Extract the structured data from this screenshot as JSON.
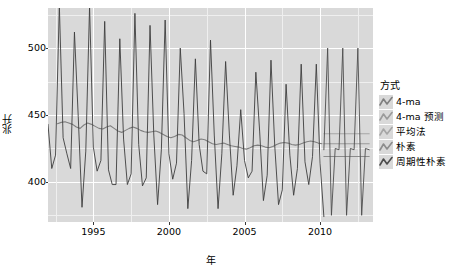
{
  "chart_data": {
    "type": "line",
    "title": "",
    "xlabel": "年",
    "ylabel": "兆升",
    "xlim": [
      1992.0,
      2013.5
    ],
    "ylim": [
      370,
      530
    ],
    "xticks": [
      1995,
      2000,
      2005,
      2010
    ],
    "yticks": [
      400,
      450,
      500
    ],
    "grid": true,
    "legend_position": "right",
    "legend_title": "方式",
    "series": [
      {
        "name": "4-ma",
        "color": "#7f7f7f",
        "kind": "moving-average",
        "x": [
          1992.625,
          1992.875,
          1993.125,
          1993.375,
          1993.625,
          1993.875,
          1994.125,
          1994.375,
          1994.625,
          1994.875,
          1995.125,
          1995.375,
          1995.625,
          1995.875,
          1996.125,
          1996.375,
          1996.625,
          1996.875,
          1997.125,
          1997.375,
          1997.625,
          1997.875,
          1998.125,
          1998.375,
          1998.625,
          1998.875,
          1999.125,
          1999.375,
          1999.625,
          1999.875,
          2000.125,
          2000.375,
          2000.625,
          2000.875,
          2001.125,
          2001.375,
          2001.625,
          2001.875,
          2002.125,
          2002.375,
          2002.625,
          2002.875,
          2003.125,
          2003.375,
          2003.625,
          2003.875,
          2004.125,
          2004.375,
          2004.625,
          2004.875,
          2005.125,
          2005.375,
          2005.625,
          2005.875,
          2006.125,
          2006.375,
          2006.625,
          2006.875,
          2007.125,
          2007.375,
          2007.625,
          2007.875,
          2008.125,
          2008.375,
          2008.625,
          2008.875,
          2009.125,
          2009.375,
          2009.625,
          2009.875,
          2010.125
        ],
        "values": [
          443.5,
          444.5,
          445.0,
          444.0,
          443.0,
          441.0,
          440.0,
          442.5,
          444.0,
          443.0,
          441.5,
          440.0,
          439.5,
          441.0,
          442.0,
          440.0,
          438.0,
          437.0,
          438.5,
          440.0,
          441.0,
          440.0,
          438.5,
          437.5,
          437.0,
          437.5,
          438.0,
          437.0,
          435.5,
          434.0,
          433.0,
          434.0,
          435.5,
          435.0,
          433.0,
          431.0,
          430.0,
          431.0,
          432.0,
          431.5,
          430.0,
          428.5,
          428.0,
          428.5,
          429.0,
          428.0,
          427.0,
          426.5,
          426.0,
          425.0,
          424.5,
          425.5,
          427.0,
          427.5,
          427.0,
          426.0,
          425.5,
          426.5,
          428.0,
          429.0,
          429.5,
          429.0,
          428.0,
          427.5,
          428.0,
          429.0,
          430.0,
          430.5,
          430.0,
          429.0,
          428.5
        ]
      },
      {
        "name": "4-ma 预测",
        "color": "#9a9a9a",
        "kind": "forecast-flat",
        "x": [
          2010.25,
          2013.25
        ],
        "values": [
          428.5,
          428.5
        ]
      },
      {
        "name": "平均法",
        "color": "#a6a6a6",
        "kind": "forecast-flat",
        "x": [
          2010.25,
          2013.25
        ],
        "values": [
          436.0,
          436.0
        ]
      },
      {
        "name": "朴素",
        "color": "#8c8c8c",
        "kind": "forecast-flat",
        "x": [
          2010.25,
          2013.25
        ],
        "values": [
          419.0,
          419.0
        ]
      },
      {
        "name": "周期性朴素",
        "color": "#4d4d4d",
        "kind": "seasonal-naive",
        "x": [
          2010.25,
          2010.5,
          2010.75,
          2011.0,
          2011.25,
          2011.5,
          2011.75,
          2012.0,
          2012.25,
          2012.5,
          2012.75,
          2013.0,
          2013.25
        ],
        "values": [
          424,
          500,
          375,
          425,
          424,
          500,
          375,
          425,
          424,
          500,
          375,
          425,
          424
        ]
      },
      {
        "name": "观测值",
        "color": "#3d3d3d",
        "kind": "observed",
        "x": [
          1992.0,
          1992.25,
          1992.5,
          1992.75,
          1993.0,
          1993.25,
          1993.5,
          1993.75,
          1994.0,
          1994.25,
          1994.5,
          1994.75,
          1995.0,
          1995.25,
          1995.5,
          1995.75,
          1996.0,
          1996.25,
          1996.5,
          1996.75,
          1997.0,
          1997.25,
          1997.5,
          1997.75,
          1998.0,
          1998.25,
          1998.5,
          1998.75,
          1999.0,
          1999.25,
          1999.5,
          1999.75,
          2000.0,
          2000.25,
          2000.5,
          2000.75,
          2001.0,
          2001.25,
          2001.5,
          2001.75,
          2002.0,
          2002.25,
          2002.5,
          2002.75,
          2003.0,
          2003.25,
          2003.5,
          2003.75,
          2004.0,
          2004.25,
          2004.5,
          2004.75,
          2005.0,
          2005.25,
          2005.5,
          2005.75,
          2006.0,
          2006.25,
          2006.5,
          2006.75,
          2007.0,
          2007.25,
          2007.5,
          2007.75,
          2008.0,
          2008.25,
          2008.5,
          2008.75,
          2009.0,
          2009.25,
          2009.5,
          2009.75,
          2010.0,
          2010.25
        ],
        "values": [
          443,
          410,
          420,
          532,
          433,
          421,
          410,
          512,
          449,
          381,
          423,
          531,
          426,
          408,
          416,
          520,
          409,
          398,
          398,
          507,
          432,
          398,
          406,
          526,
          428,
          397,
          403,
          517,
          435,
          383,
          424,
          521,
          421,
          402,
          414,
          500,
          451,
          380,
          416,
          492,
          428,
          408,
          406,
          506,
          435,
          380,
          421,
          490,
          435,
          390,
          412,
          454,
          416,
          403,
          408,
          482,
          438,
          386,
          405,
          491,
          427,
          383,
          394,
          473,
          420,
          390,
          410,
          488,
          415,
          398,
          419,
          488,
          414,
          374
        ]
      }
    ]
  },
  "axes": {
    "ylabel": "兆升",
    "xlabel": "年",
    "ytick_labels": [
      "500",
      "450",
      "400"
    ],
    "xtick_labels": [
      "1995",
      "2000",
      "2005",
      "2010"
    ]
  },
  "legend": {
    "title": "方式",
    "items": [
      {
        "label": "4-ma"
      },
      {
        "label": "4-ma 预测"
      },
      {
        "label": "平均法"
      },
      {
        "label": "朴素"
      },
      {
        "label": "周期性朴素"
      }
    ]
  },
  "colors": {
    "panel_background": "#d9d9d9",
    "grid_major": "#ffffff",
    "grid_minor": "#efefef",
    "observed_line": "#3d3d3d",
    "ma_line": "#7f7f7f",
    "page_background": "#ffffff"
  }
}
